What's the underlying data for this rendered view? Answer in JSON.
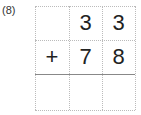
{
  "problem": {
    "label": "(8)",
    "rows": [
      [
        "",
        "3",
        "3"
      ],
      [
        "+",
        "7",
        "8"
      ],
      [
        "",
        "",
        ""
      ]
    ]
  }
}
